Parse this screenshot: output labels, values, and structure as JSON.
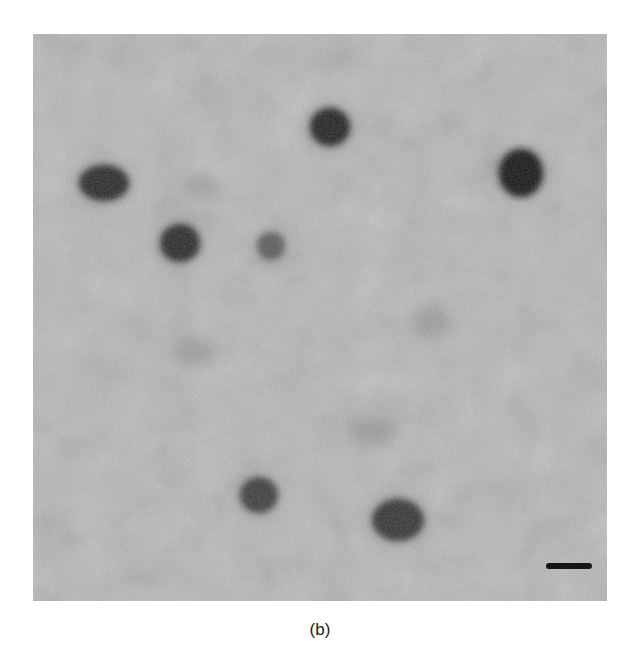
{
  "figure": {
    "caption": "(b)",
    "panel": {
      "x": 33,
      "y": 34,
      "width": 574,
      "height": 567,
      "background_color": "#b4b4b4",
      "description": "grayscale micrograph with scattered dark particles"
    },
    "particles": [
      {
        "cx": 104,
        "cy": 183,
        "rx": 25,
        "ry": 18,
        "darkness": 0.85
      },
      {
        "cx": 330,
        "cy": 127,
        "rx": 20,
        "ry": 19,
        "darkness": 0.9
      },
      {
        "cx": 521,
        "cy": 173,
        "rx": 22,
        "ry": 24,
        "darkness": 0.97
      },
      {
        "cx": 180,
        "cy": 243,
        "rx": 20,
        "ry": 19,
        "darkness": 0.85
      },
      {
        "cx": 271,
        "cy": 246,
        "rx": 14,
        "ry": 14,
        "darkness": 0.55
      },
      {
        "cx": 259,
        "cy": 495,
        "rx": 19,
        "ry": 18,
        "darkness": 0.75
      },
      {
        "cx": 398,
        "cy": 520,
        "rx": 26,
        "ry": 21,
        "darkness": 0.8
      }
    ],
    "faint_spots": [
      {
        "cx": 195,
        "cy": 352,
        "rx": 22,
        "ry": 14
      },
      {
        "cx": 430,
        "cy": 322,
        "rx": 20,
        "ry": 16
      },
      {
        "cx": 372,
        "cy": 432,
        "rx": 26,
        "ry": 14
      },
      {
        "cx": 200,
        "cy": 186,
        "rx": 18,
        "ry": 10
      }
    ],
    "scale_bar": {
      "x1": 546,
      "x2": 592,
      "y": 566,
      "color": "#151515",
      "label": ""
    }
  }
}
